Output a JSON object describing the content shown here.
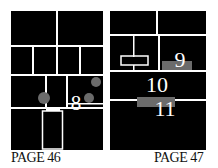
{
  "pages": [
    {
      "label": "PAGE 46",
      "panel_marker": "8"
    },
    {
      "label": "PAGE 47",
      "panel_markers": [
        "9",
        "10",
        "11"
      ]
    }
  ],
  "colors": {
    "panel": "#000000",
    "gutter": "#ffffff",
    "highlight": "#6b6b6b",
    "text": "#111111"
  }
}
